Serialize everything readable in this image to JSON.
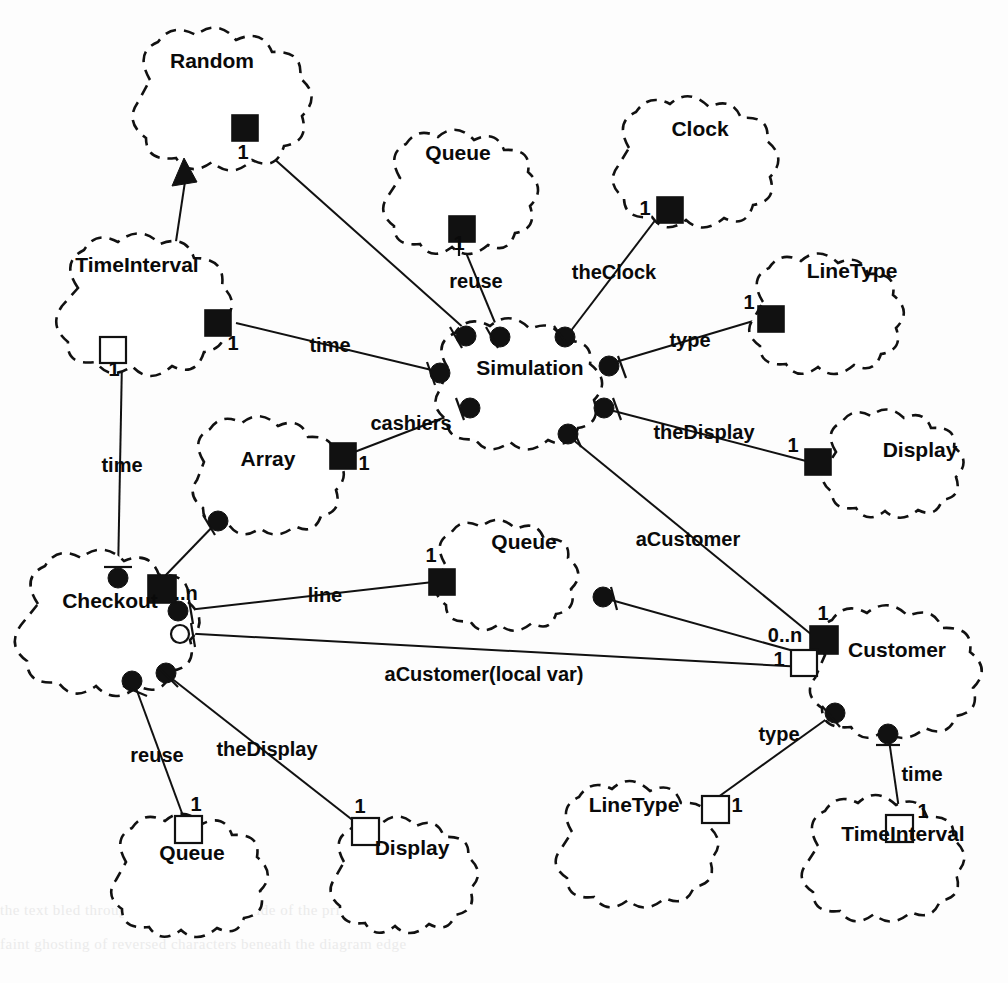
{
  "diagram": {
    "notation": "Booch-style class/object clouds with role adornments",
    "background_color": "#fdfdfd",
    "ink_color": "#111111",
    "classes": [
      {
        "id": "random",
        "label": "Random",
        "cx": 222,
        "cy": 110,
        "rx": 95,
        "ry": 75,
        "label_x": 212,
        "label_y": 68
      },
      {
        "id": "timeinterval1",
        "label": "TimeInterval",
        "cx": 145,
        "cy": 310,
        "rx": 90,
        "ry": 70,
        "label_x": 137,
        "label_y": 272
      },
      {
        "id": "queue_top",
        "label": "Queue",
        "cx": 466,
        "cy": 196,
        "rx": 78,
        "ry": 62,
        "label_x": 458,
        "label_y": 160
      },
      {
        "id": "clock",
        "label": "Clock",
        "cx": 700,
        "cy": 166,
        "rx": 82,
        "ry": 66,
        "label_x": 700,
        "label_y": 136
      },
      {
        "id": "linetype_r",
        "label": "LineType",
        "cx": 843,
        "cy": 320,
        "rx": 88,
        "ry": 62,
        "label_x": 852,
        "label_y": 278
      },
      {
        "id": "simulation",
        "label": "Simulation",
        "cx": 530,
        "cy": 392,
        "rx": 92,
        "ry": 66,
        "label_x": 530,
        "label_y": 375
      },
      {
        "id": "display_r",
        "label": "Display",
        "cx": 910,
        "cy": 466,
        "rx": 82,
        "ry": 56,
        "label_x": 920,
        "label_y": 457
      },
      {
        "id": "array",
        "label": "Array",
        "cx": 282,
        "cy": 477,
        "rx": 86,
        "ry": 58,
        "label_x": 268,
        "label_y": 466
      },
      {
        "id": "queue_mid",
        "label": "Queue",
        "cx": 520,
        "cy": 578,
        "rx": 82,
        "ry": 58,
        "label_x": 524,
        "label_y": 549
      },
      {
        "id": "checkout",
        "label": "Checkout",
        "cx": 118,
        "cy": 625,
        "rx": 96,
        "ry": 68,
        "label_x": 110,
        "label_y": 608
      },
      {
        "id": "customer",
        "label": "Customer",
        "cx": 905,
        "cy": 672,
        "rx": 98,
        "ry": 62,
        "label_x": 897,
        "label_y": 657
      },
      {
        "id": "queue_bl",
        "label": "Queue",
        "cx": 192,
        "cy": 878,
        "rx": 78,
        "ry": 60,
        "label_x": 192,
        "label_y": 860
      },
      {
        "id": "display_bl",
        "label": "Display",
        "cx": 407,
        "cy": 876,
        "rx": 76,
        "ry": 58,
        "label_x": 412,
        "label_y": 855
      },
      {
        "id": "linetype_br",
        "label": "LineType",
        "cx": 652,
        "cy": 848,
        "rx": 86,
        "ry": 62,
        "label_x": 634,
        "label_y": 812
      },
      {
        "id": "timeinterval2",
        "label": "TimeInterval",
        "cx": 898,
        "cy": 862,
        "rx": 86,
        "ry": 62,
        "label_x": 903,
        "label_y": 841
      }
    ],
    "relationships": [
      {
        "id": "rel-random-sim",
        "label": "",
        "from": "random",
        "to": "simulation",
        "multiplicity": "1"
      },
      {
        "id": "rel-ti-inherits",
        "label": "",
        "from": "timeinterval1",
        "to": "random",
        "kind": "inheritance"
      },
      {
        "id": "rel-time-sim",
        "label": "time",
        "from": "timeinterval1",
        "to": "simulation",
        "multiplicity": "1"
      },
      {
        "id": "rel-reuse-sim",
        "label": "reuse",
        "from": "queue_top",
        "to": "simulation",
        "multiplicity": "1"
      },
      {
        "id": "rel-theclock-sim",
        "label": "theClock",
        "from": "clock",
        "to": "simulation",
        "multiplicity": "1"
      },
      {
        "id": "rel-type-sim",
        "label": "type",
        "from": "linetype_r",
        "to": "simulation",
        "multiplicity": "1"
      },
      {
        "id": "rel-thedisplay-sim",
        "label": "theDisplay",
        "from": "display_r",
        "to": "simulation",
        "multiplicity": "1"
      },
      {
        "id": "rel-cashiers-sim",
        "label": "cashiers",
        "from": "array",
        "to": "simulation",
        "multiplicity": "1"
      },
      {
        "id": "rel-acustomer-sim",
        "label": "aCustomer",
        "from": "simulation",
        "to": "customer",
        "multiplicity": "1"
      },
      {
        "id": "rel-time-checkout",
        "label": "time",
        "from": "timeinterval1",
        "to": "checkout",
        "multiplicity": "1"
      },
      {
        "id": "rel-array-checkout",
        "label": "",
        "from": "array",
        "to": "checkout",
        "multiplicity": "0..n"
      },
      {
        "id": "rel-line-queue",
        "label": "line",
        "from": "checkout",
        "to": "queue_mid",
        "multiplicity": "1"
      },
      {
        "id": "rel-acustomer-local",
        "label": "aCustomer(local var)",
        "from": "checkout",
        "to": "customer",
        "multiplicity": "1"
      },
      {
        "id": "rel-queue-customer",
        "label": "",
        "from": "queue_mid",
        "to": "customer",
        "multiplicity": "0..n"
      },
      {
        "id": "rel-reuse-checkout",
        "label": "reuse",
        "from": "checkout",
        "to": "queue_bl",
        "multiplicity": "1"
      },
      {
        "id": "rel-thedisplay-co",
        "label": "theDisplay",
        "from": "checkout",
        "to": "display_bl",
        "multiplicity": "1"
      },
      {
        "id": "rel-type-customer",
        "label": "type",
        "from": "customer",
        "to": "linetype_br",
        "multiplicity": "1"
      },
      {
        "id": "rel-time-customer",
        "label": "time",
        "from": "customer",
        "to": "timeinterval2",
        "multiplicity": "1"
      }
    ],
    "edge_labels": [
      {
        "id": "lbl-time-upper",
        "text": "time",
        "x": 330,
        "y": 352,
        "anchor": "middle"
      },
      {
        "id": "lbl-reuse-upper",
        "text": "reuse",
        "x": 476,
        "y": 288,
        "anchor": "middle"
      },
      {
        "id": "lbl-theclock",
        "text": "theClock",
        "x": 614,
        "y": 279,
        "anchor": "middle"
      },
      {
        "id": "lbl-type-upper",
        "text": "type",
        "x": 690,
        "y": 347,
        "anchor": "middle"
      },
      {
        "id": "lbl-cashiers",
        "text": "cashiers",
        "x": 411,
        "y": 430,
        "anchor": "middle"
      },
      {
        "id": "lbl-thedisplay-r",
        "text": "theDisplay",
        "x": 704,
        "y": 439,
        "anchor": "middle"
      },
      {
        "id": "lbl-time-left",
        "text": "time",
        "x": 122,
        "y": 472,
        "anchor": "middle"
      },
      {
        "id": "lbl-acustomer",
        "text": "aCustomer",
        "x": 688,
        "y": 546,
        "anchor": "middle"
      },
      {
        "id": "lbl-line",
        "text": "line",
        "x": 325,
        "y": 602,
        "anchor": "middle"
      },
      {
        "id": "lbl-acust-local",
        "text": "aCustomer(local var)",
        "x": 484,
        "y": 681,
        "anchor": "middle"
      },
      {
        "id": "lbl-reuse-lower",
        "text": "reuse",
        "x": 157,
        "y": 762,
        "anchor": "middle"
      },
      {
        "id": "lbl-thedisplay-b",
        "text": "theDisplay",
        "x": 267,
        "y": 756,
        "anchor": "middle"
      },
      {
        "id": "lbl-type-lower",
        "text": "type",
        "x": 779,
        "y": 741,
        "anchor": "middle"
      },
      {
        "id": "lbl-time-lower",
        "text": "time",
        "x": 922,
        "y": 781,
        "anchor": "middle"
      }
    ],
    "multiplicities": [
      {
        "id": "mult-random",
        "text": "1",
        "x": 243,
        "y": 159,
        "anchor": "middle"
      },
      {
        "id": "mult-queue-top",
        "text": "1",
        "x": 459,
        "y": 247,
        "anchor": "middle"
      },
      {
        "id": "mult-clock",
        "text": "1",
        "x": 645,
        "y": 215,
        "anchor": "middle"
      },
      {
        "id": "mult-linetype-r",
        "text": "1",
        "x": 749,
        "y": 309,
        "anchor": "middle"
      },
      {
        "id": "mult-ti-top",
        "text": "1",
        "x": 233,
        "y": 344,
        "anchor": "middle"
      },
      {
        "id": "mult-ti-bot",
        "text": "1",
        "x": 116,
        "y": 372,
        "anchor": "middle"
      },
      {
        "id": "mult-array",
        "text": "1",
        "x": 362,
        "y": 466,
        "anchor": "middle"
      },
      {
        "id": "mult-display-r",
        "text": "1",
        "x": 797,
        "y": 452,
        "anchor": "middle"
      },
      {
        "id": "mult-queue-mid",
        "text": "1",
        "x": 430,
        "y": 572,
        "anchor": "middle"
      },
      {
        "id": "mult-checkout-n",
        "text": "..n",
        "x": 186,
        "y": 599,
        "anchor": "middle"
      },
      {
        "id": "mult-customer-top",
        "text": "1",
        "x": 823,
        "y": 618,
        "anchor": "middle"
      },
      {
        "id": "mult-customer-0n",
        "text": "0..n",
        "x": 790,
        "y": 639,
        "anchor": "middle"
      },
      {
        "id": "mult-customer-one",
        "text": "1",
        "x": 779,
        "y": 663,
        "anchor": "middle"
      },
      {
        "id": "mult-queue-bl",
        "text": "1",
        "x": 193,
        "y": 808,
        "anchor": "middle"
      },
      {
        "id": "mult-display-bl",
        "text": "1",
        "x": 362,
        "y": 810,
        "anchor": "middle"
      },
      {
        "id": "mult-linetype-br",
        "text": "1",
        "x": 735,
        "y": 806,
        "anchor": "middle"
      },
      {
        "id": "mult-ti2",
        "text": "1",
        "x": 925,
        "y": 817,
        "anchor": "middle"
      }
    ],
    "page_bleed": [
      {
        "text": "the text bled through from the reverse side of the printed page",
        "top": 902
      },
      {
        "text": "faint ghosting of reversed characters beneath the diagram edge",
        "top": 936
      }
    ]
  }
}
